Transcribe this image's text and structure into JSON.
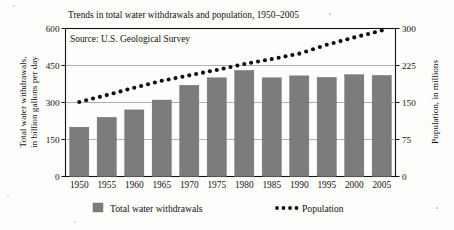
{
  "figure": {
    "title": "Trends in total water withdrawals and population, 1950–2005",
    "source": "Source: U.S. Geological Survey",
    "left_axis_label_line1": "Total water withdrawals,",
    "left_axis_label_line2": "in billion gallons per day",
    "right_axis_label": "Population, in millions",
    "bar_color": "#7c7c7c",
    "dot_color": "#0d0d0d"
  },
  "legend": {
    "bars_label": "Total water withdrawals",
    "line_label": "Population"
  },
  "chart_data": {
    "type": "bar",
    "title": "Trends in total water withdrawals and population, 1950–2005",
    "subtitle": "Source: U.S. Geological Survey",
    "xlabel": "",
    "ylabel": "Total water withdrawals, in billion gallons per day",
    "y2label": "Population, in millions",
    "categories": [
      "1950",
      "1955",
      "1960",
      "1965",
      "1970",
      "1975",
      "1980",
      "1985",
      "1990",
      "1995",
      "2000",
      "2005"
    ],
    "ylim": [
      0,
      600
    ],
    "y2lim": [
      0,
      300
    ],
    "yticks": [
      "0",
      "150",
      "300",
      "450",
      "600"
    ],
    "ytick_values": [
      0,
      150,
      300,
      450,
      600
    ],
    "y2ticks": [
      "0",
      "75",
      "150",
      "225",
      "300"
    ],
    "y2tick_values": [
      0,
      75,
      150,
      225,
      300
    ],
    "grid": true,
    "legend_position": "bottom",
    "series": [
      {
        "name": "Total water withdrawals",
        "type": "bar",
        "axis": "left",
        "units": "billion gallons per day",
        "values": [
          200,
          240,
          270,
          310,
          370,
          400,
          430,
          400,
          408,
          402,
          413,
          410
        ]
      },
      {
        "name": "Population",
        "type": "line",
        "style": "dotted",
        "axis": "right",
        "units": "millions",
        "values": [
          151,
          165,
          180,
          194,
          205,
          216,
          228,
          238,
          249,
          267,
          282,
          296
        ]
      }
    ]
  }
}
